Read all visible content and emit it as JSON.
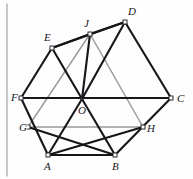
{
  "figure": {
    "width": 193,
    "height": 179,
    "background_color": "#fefefe",
    "colors": {
      "solid_stroke": "#16161a",
      "light_stroke": "#9a9a9a",
      "gray_rule": "#a8a8a8",
      "margin_line": "#b0b0b0",
      "vertex_marker": "#2b2b30",
      "label_text": "#16161a"
    },
    "points": [
      {
        "id": "A",
        "label": "A",
        "x": 48,
        "y": 155,
        "label_x": 44,
        "label_y": 170,
        "marker": "square"
      },
      {
        "id": "B",
        "label": "B",
        "x": 115,
        "y": 155,
        "label_x": 112,
        "label_y": 170,
        "marker": "square"
      },
      {
        "id": "C",
        "label": "C",
        "x": 171,
        "y": 98,
        "label_x": 177,
        "label_y": 102,
        "marker": "square"
      },
      {
        "id": "D",
        "label": "D",
        "x": 125,
        "y": 22,
        "label_x": 128,
        "label_y": 15,
        "marker": "square"
      },
      {
        "id": "E",
        "label": "E",
        "x": 52,
        "y": 48,
        "label_x": 44,
        "label_y": 41,
        "marker": "square"
      },
      {
        "id": "F",
        "label": "F",
        "x": 21,
        "y": 98,
        "label_x": 11,
        "label_y": 101,
        "marker": "square"
      },
      {
        "id": "O",
        "label": "O",
        "x": 82,
        "y": 99,
        "label_x": 78,
        "label_y": 114,
        "marker": "dot"
      },
      {
        "id": "G",
        "label": "G",
        "x": 28,
        "y": 127,
        "label_x": 19,
        "label_y": 131,
        "marker": "square"
      },
      {
        "id": "H",
        "label": "H",
        "x": 143,
        "y": 127,
        "label_x": 147,
        "label_y": 132,
        "marker": "square"
      },
      {
        "id": "J",
        "label": "J",
        "x": 90,
        "y": 34,
        "label_x": 84,
        "label_y": 27,
        "marker": "square"
      }
    ],
    "solid_segments": [
      {
        "name": "segment-A-B",
        "from": "A",
        "to": "B"
      },
      {
        "name": "segment-B-C",
        "from": "B",
        "to": "C"
      },
      {
        "name": "segment-C-D",
        "from": "C",
        "to": "D"
      },
      {
        "name": "segment-D-E",
        "from": "D",
        "to": "E"
      },
      {
        "name": "segment-E-F",
        "from": "E",
        "to": "F"
      },
      {
        "name": "segment-F-A",
        "from": "F",
        "to": "A"
      },
      {
        "name": "segment-F-C",
        "from": "F",
        "to": "C"
      },
      {
        "name": "segment-O-A",
        "from": "O",
        "to": "A"
      },
      {
        "name": "segment-O-B",
        "from": "O",
        "to": "B"
      },
      {
        "name": "segment-O-D",
        "from": "O",
        "to": "D"
      },
      {
        "name": "segment-O-E",
        "from": "O",
        "to": "E"
      },
      {
        "name": "segment-E-J",
        "from": "E",
        "to": "J"
      },
      {
        "name": "segment-J-D",
        "from": "J",
        "to": "D"
      },
      {
        "name": "segment-J-O",
        "from": "J",
        "to": "O"
      },
      {
        "name": "segment-G-B",
        "from": "G",
        "to": "B"
      },
      {
        "name": "segment-H-A",
        "from": "H",
        "to": "A"
      }
    ],
    "light_segments": [
      {
        "name": "segment-G-H",
        "from": "G",
        "to": "H"
      },
      {
        "name": "segment-G-J",
        "from": "G",
        "to": "J"
      },
      {
        "name": "segment-J-H",
        "from": "J",
        "to": "H"
      }
    ],
    "margin_rule": {
      "name": "page-margin-rule",
      "x": 7,
      "y1": 4,
      "y2": 176
    }
  }
}
